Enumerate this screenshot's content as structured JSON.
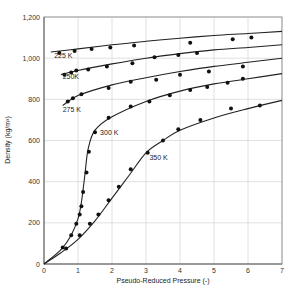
{
  "chart_data": {
    "type": "line",
    "title": "",
    "xlabel": "Pseudo-Reduced Pressure (-)",
    "ylabel": "Density (kg/m³)",
    "xlim": [
      0,
      7
    ],
    "ylim": [
      0,
      1200
    ],
    "xticks": [
      "0",
      "1",
      "2",
      "3",
      "4",
      "5",
      "6",
      "7"
    ],
    "yticks": [
      "0",
      "200",
      "400",
      "600",
      "800",
      "1,000",
      "1,200"
    ],
    "grid": true,
    "legend": "inline curve labels",
    "series": [
      {
        "name": "225 K",
        "curve": [
          [
            0.2,
            1030
          ],
          [
            1,
            1045
          ],
          [
            2,
            1065
          ],
          [
            3,
            1082
          ],
          [
            4,
            1097
          ],
          [
            5,
            1110
          ],
          [
            6,
            1120
          ],
          [
            7,
            1130
          ]
        ],
        "points": [
          [
            0.45,
            1025
          ],
          [
            0.9,
            1035
          ],
          [
            1.4,
            1045
          ],
          [
            1.95,
            1052
          ],
          [
            2.65,
            1062
          ],
          [
            4.3,
            1075
          ],
          [
            5.55,
            1092
          ],
          [
            6.1,
            1100
          ]
        ]
      },
      {
        "name": "250K",
        "curve": [
          [
            0.5,
            920
          ],
          [
            1,
            940
          ],
          [
            2,
            972
          ],
          [
            3,
            1000
          ],
          [
            4,
            1022
          ],
          [
            5,
            1040
          ],
          [
            6,
            1052
          ],
          [
            7,
            1065
          ]
        ],
        "points": [
          [
            0.6,
            920
          ],
          [
            0.8,
            930
          ],
          [
            0.95,
            940
          ],
          [
            1.3,
            945
          ],
          [
            1.85,
            960
          ],
          [
            2.6,
            975
          ],
          [
            3.25,
            1005
          ],
          [
            3.95,
            1015
          ],
          [
            4.5,
            1025
          ]
        ]
      },
      {
        "name": "275 K",
        "curve": [
          [
            0.55,
            770
          ],
          [
            1,
            818
          ],
          [
            2,
            870
          ],
          [
            3,
            905
          ],
          [
            4,
            935
          ],
          [
            5,
            960
          ],
          [
            6,
            980
          ],
          [
            7,
            1000
          ]
        ],
        "points": [
          [
            0.7,
            790
          ],
          [
            0.85,
            805
          ],
          [
            1.1,
            825
          ],
          [
            1.9,
            855
          ],
          [
            2.55,
            885
          ],
          [
            3.3,
            895
          ],
          [
            4.0,
            920
          ],
          [
            4.85,
            935
          ],
          [
            5.85,
            960
          ]
        ]
      },
      {
        "name": "300 K",
        "curve": [
          [
            0,
            0
          ],
          [
            0.5,
            70
          ],
          [
            0.8,
            140
          ],
          [
            1.0,
            220
          ],
          [
            1.1,
            300
          ],
          [
            1.2,
            430
          ],
          [
            1.3,
            560
          ],
          [
            1.5,
            650
          ],
          [
            2,
            715
          ],
          [
            3,
            790
          ],
          [
            4,
            840
          ],
          [
            5,
            875
          ],
          [
            6,
            900
          ],
          [
            7,
            925
          ]
        ],
        "points": [
          [
            0.55,
            80
          ],
          [
            0.8,
            140
          ],
          [
            0.95,
            195
          ],
          [
            1.05,
            240
          ],
          [
            1.1,
            280
          ],
          [
            1.15,
            350
          ],
          [
            1.25,
            445
          ],
          [
            1.32,
            545
          ],
          [
            1.5,
            640
          ],
          [
            1.9,
            710
          ],
          [
            2.55,
            765
          ],
          [
            3.1,
            790
          ],
          [
            3.7,
            820
          ],
          [
            4.3,
            845
          ],
          [
            4.8,
            860
          ],
          [
            5.4,
            880
          ],
          [
            5.85,
            900
          ]
        ]
      },
      {
        "name": "350 K",
        "curve": [
          [
            0,
            0
          ],
          [
            0.5,
            55
          ],
          [
            1,
            120
          ],
          [
            1.5,
            210
          ],
          [
            2,
            320
          ],
          [
            2.5,
            430
          ],
          [
            3,
            540
          ],
          [
            3.5,
            600
          ],
          [
            4,
            650
          ],
          [
            5,
            710
          ],
          [
            6,
            755
          ],
          [
            7,
            795
          ]
        ],
        "points": [
          [
            0.65,
            75
          ],
          [
            1.05,
            140
          ],
          [
            1.35,
            195
          ],
          [
            1.6,
            240
          ],
          [
            1.9,
            310
          ],
          [
            2.2,
            375
          ],
          [
            2.55,
            460
          ],
          [
            3.05,
            540
          ],
          [
            3.5,
            600
          ],
          [
            3.95,
            655
          ],
          [
            4.6,
            700
          ],
          [
            5.5,
            755
          ],
          [
            6.35,
            770
          ]
        ]
      }
    ]
  },
  "caption": "Figure: Density vs. pseudo-reduced pressure"
}
